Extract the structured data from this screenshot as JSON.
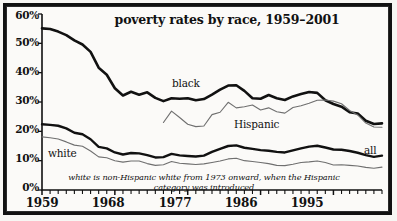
{
  "chart_data": {
    "type": "line",
    "title": "poverty rates by race, 1959–2001",
    "xlabel": "",
    "ylabel": "",
    "xlim": [
      1959,
      2001
    ],
    "ylim": [
      0,
      60
    ],
    "grid": false,
    "legend_position": "inline-labels",
    "ytick_labels": [
      "60%",
      "50%",
      "40%",
      "30%",
      "20%",
      "10%",
      "0%"
    ],
    "ytick_values": [
      60,
      50,
      40,
      30,
      20,
      10,
      0
    ],
    "xtick_labels": [
      "1959",
      "1968",
      "1977",
      "1986",
      "1995"
    ],
    "xtick_values": [
      1959,
      1968,
      1977,
      1986,
      1995
    ],
    "xtick_minor_step": 1,
    "annotation": "white is non-Hispanic white from 1973 onward, when the Hispanic category was introduced",
    "series": [
      {
        "name": "black",
        "label": "black",
        "color": "#111111",
        "width": 2.6,
        "x": [
          1959,
          1960,
          1961,
          1962,
          1963,
          1964,
          1965,
          1966,
          1967,
          1968,
          1969,
          1970,
          1971,
          1972,
          1973,
          1974,
          1975,
          1976,
          1977,
          1978,
          1979,
          1980,
          1981,
          1982,
          1983,
          1984,
          1985,
          1986,
          1987,
          1988,
          1989,
          1990,
          1991,
          1992,
          1993,
          1994,
          1995,
          1996,
          1997,
          1998,
          1999,
          2000,
          2001
        ],
        "values": [
          55.1,
          54.9,
          54.0,
          52.8,
          51.0,
          49.6,
          47.1,
          41.7,
          39.3,
          34.7,
          32.2,
          33.5,
          32.5,
          33.3,
          31.4,
          30.3,
          31.3,
          31.1,
          31.3,
          30.6,
          31.0,
          32.5,
          34.2,
          35.6,
          35.7,
          33.8,
          31.3,
          31.1,
          32.4,
          31.3,
          30.7,
          31.9,
          32.7,
          33.4,
          33.1,
          30.6,
          29.3,
          28.4,
          26.5,
          26.1,
          23.6,
          22.5,
          22.7
        ]
      },
      {
        "name": "hispanic",
        "label": "Hispanic",
        "color": "#6f6f6f",
        "width": 1.1,
        "x": [
          1974,
          1975,
          1976,
          1977,
          1978,
          1979,
          1980,
          1981,
          1982,
          1983,
          1984,
          1985,
          1986,
          1987,
          1988,
          1989,
          1990,
          1991,
          1992,
          1993,
          1994,
          1995,
          1996,
          1997,
          1998,
          1999,
          2000,
          2001
        ],
        "values": [
          23.0,
          26.9,
          24.7,
          22.4,
          21.6,
          21.8,
          25.7,
          26.5,
          29.9,
          28.0,
          28.4,
          29.0,
          27.3,
          28.0,
          26.7,
          26.2,
          28.1,
          28.7,
          29.6,
          30.6,
          30.7,
          30.3,
          29.4,
          27.1,
          25.6,
          22.8,
          21.5,
          21.4
        ]
      },
      {
        "name": "all",
        "label": "all",
        "color": "#111111",
        "width": 2.4,
        "x": [
          1959,
          1960,
          1961,
          1962,
          1963,
          1964,
          1965,
          1966,
          1967,
          1968,
          1969,
          1970,
          1971,
          1972,
          1973,
          1974,
          1975,
          1976,
          1977,
          1978,
          1979,
          1980,
          1981,
          1982,
          1983,
          1984,
          1985,
          1986,
          1987,
          1988,
          1989,
          1990,
          1991,
          1992,
          1993,
          1994,
          1995,
          1996,
          1997,
          1998,
          1999,
          2000,
          2001
        ],
        "values": [
          22.4,
          22.2,
          21.9,
          21.0,
          19.5,
          19.0,
          17.3,
          14.7,
          14.2,
          12.8,
          12.1,
          12.6,
          12.5,
          11.9,
          11.1,
          11.2,
          12.3,
          11.8,
          11.6,
          11.4,
          11.7,
          13.0,
          14.0,
          15.0,
          15.2,
          14.4,
          14.0,
          13.6,
          13.4,
          13.0,
          12.8,
          13.5,
          14.2,
          14.8,
          15.1,
          14.5,
          13.8,
          13.7,
          13.3,
          12.7,
          11.9,
          11.3,
          11.7
        ]
      },
      {
        "name": "white",
        "label": "white",
        "color": "#6f6f6f",
        "width": 1.1,
        "x": [
          1959,
          1960,
          1961,
          1962,
          1963,
          1964,
          1965,
          1966,
          1967,
          1968,
          1969,
          1970,
          1971,
          1972,
          1973,
          1974,
          1975,
          1976,
          1977,
          1978,
          1979,
          1980,
          1981,
          1982,
          1983,
          1984,
          1985,
          1986,
          1987,
          1988,
          1989,
          1990,
          1991,
          1992,
          1993,
          1994,
          1995,
          1996,
          1997,
          1998,
          1999,
          2000,
          2001
        ],
        "values": [
          18.1,
          17.8,
          17.4,
          16.4,
          15.3,
          14.9,
          13.3,
          11.3,
          11.0,
          10.0,
          9.5,
          9.9,
          9.9,
          9.0,
          8.4,
          8.6,
          9.7,
          9.1,
          8.9,
          8.7,
          8.9,
          9.4,
          9.9,
          10.6,
          10.8,
          10.0,
          9.7,
          9.4,
          9.0,
          8.4,
          8.3,
          8.8,
          9.4,
          9.6,
          9.9,
          9.4,
          8.5,
          8.6,
          8.4,
          8.2,
          7.7,
          7.4,
          7.8
        ]
      }
    ]
  }
}
